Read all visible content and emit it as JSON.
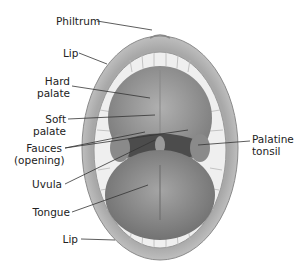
{
  "diagram": {
    "labels": {
      "philtrum": "Philtrum",
      "lip_upper": "Lip",
      "hard_palate_1": "Hard",
      "hard_palate_2": "palate",
      "soft_palate_1": "Soft",
      "soft_palate_2": "palate",
      "fauces_1": "Fauces",
      "fauces_2": "(opening)",
      "uvula": "Uvula",
      "tongue": "Tongue",
      "lip_lower": "Lip",
      "palatine_tonsil_1": "Palatine",
      "palatine_tonsil_2": "tonsil"
    },
    "colors": {
      "lip": "#b9b9b9",
      "teeth": "#f2f2f2",
      "palate": "#9a9a9a",
      "throat": "#555555",
      "tongue": "#8d8d8d",
      "leader": "#333333"
    }
  }
}
